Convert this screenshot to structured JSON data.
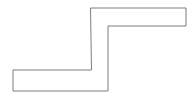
{
  "figure": {
    "canvas": {
      "width": 196,
      "height": 94,
      "background_color": "#ffffff"
    },
    "shape": {
      "name": "z-step-polygon",
      "type": "polygon",
      "sides": 8,
      "closed": true,
      "fill_color": "#ffffff",
      "stroke_color": "#7d7d7d",
      "stroke_width": 1,
      "points": "91,8 186,8 186,26 108,26 108,91 13,91 13,70 91,70",
      "vertices": [
        {
          "label": "A",
          "x": 91,
          "y": 8
        },
        {
          "label": "B",
          "x": 186,
          "y": 8
        },
        {
          "label": "C",
          "x": 186,
          "y": 26
        },
        {
          "label": "D",
          "x": 108,
          "y": 26
        },
        {
          "label": "E",
          "x": 108,
          "y": 91
        },
        {
          "label": "F",
          "x": 13,
          "y": 91
        },
        {
          "label": "G",
          "x": 13,
          "y": 70
        },
        {
          "label": "H",
          "x": 91,
          "y": 70
        }
      ]
    }
  }
}
